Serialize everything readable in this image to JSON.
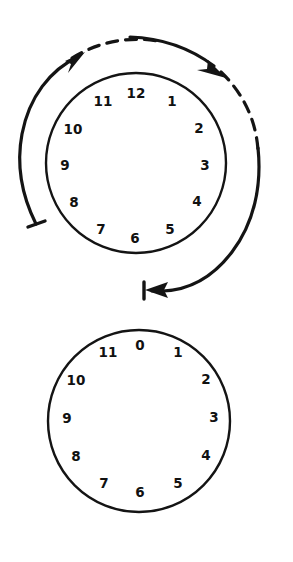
{
  "figure": {
    "background_color": "#ffffff",
    "ink_color": "#141414",
    "width": 293,
    "height": 562
  },
  "clocks": [
    {
      "id": "upper-clock",
      "name": "twelve-hour-dial",
      "center": {
        "x": 136,
        "y": 163
      },
      "radius": 90,
      "numeral_radius": 72,
      "start_label": "12",
      "numerals": [
        {
          "label": "12",
          "angle_deg": 0,
          "x": 136,
          "y": 93
        },
        {
          "label": "1",
          "angle_deg": 30,
          "x": 172,
          "y": 101
        },
        {
          "label": "2",
          "angle_deg": 60,
          "x": 199,
          "y": 128
        },
        {
          "label": "3",
          "angle_deg": 90,
          "x": 205,
          "y": 165
        },
        {
          "label": "4",
          "angle_deg": 120,
          "x": 197,
          "y": 201
        },
        {
          "label": "5",
          "angle_deg": 150,
          "x": 170,
          "y": 229
        },
        {
          "label": "6",
          "angle_deg": 180,
          "x": 135,
          "y": 238
        },
        {
          "label": "7",
          "angle_deg": 210,
          "x": 101,
          "y": 229
        },
        {
          "label": "8",
          "angle_deg": 240,
          "x": 74,
          "y": 202
        },
        {
          "label": "9",
          "angle_deg": 270,
          "x": 65,
          "y": 165
        },
        {
          "label": "10",
          "angle_deg": 300,
          "x": 73,
          "y": 129
        },
        {
          "label": "11",
          "angle_deg": 330,
          "x": 103,
          "y": 101
        }
      ]
    },
    {
      "id": "lower-clock",
      "name": "zero-based-twelve-hour-dial",
      "center": {
        "x": 139,
        "y": 421
      },
      "radius": 91,
      "numeral_radius": 73,
      "start_label": "0",
      "numerals": [
        {
          "label": "0",
          "angle_deg": 0,
          "x": 140,
          "y": 345
        },
        {
          "label": "1",
          "angle_deg": 30,
          "x": 178,
          "y": 352
        },
        {
          "label": "2",
          "angle_deg": 60,
          "x": 206,
          "y": 379
        },
        {
          "label": "3",
          "angle_deg": 90,
          "x": 214,
          "y": 417
        },
        {
          "label": "4",
          "angle_deg": 120,
          "x": 206,
          "y": 455
        },
        {
          "label": "5",
          "angle_deg": 150,
          "x": 178,
          "y": 483
        },
        {
          "label": "6",
          "angle_deg": 180,
          "x": 140,
          "y": 492
        },
        {
          "label": "7",
          "angle_deg": 210,
          "x": 104,
          "y": 483
        },
        {
          "label": "8",
          "angle_deg": 240,
          "x": 76,
          "y": 456
        },
        {
          "label": "9",
          "angle_deg": 270,
          "x": 67,
          "y": 418
        },
        {
          "label": "10",
          "angle_deg": 300,
          "x": 76,
          "y": 380
        },
        {
          "label": "11",
          "angle_deg": 330,
          "x": 108,
          "y": 352
        }
      ]
    }
  ],
  "arrows": [
    {
      "id": "inner-sweep-arrow",
      "name": "clockwise-outer-arc-arrow",
      "style": "solid",
      "direction": "clockwise",
      "start_marker": "tail-bar",
      "end_marker": "arrowhead",
      "description": "Solid arc sweeping clockwise from lower-left tail bar up to an arrowhead near the 11 o'clock position"
    },
    {
      "id": "dashed-sweep-arrow",
      "name": "dashed-clockwise-arc-arrow",
      "style": "dashed",
      "direction": "clockwise",
      "start_marker": "none",
      "end_marker": "arrowhead",
      "description": "Dashed arc running clockwise across the top with an arrowhead near the 1-2 o'clock position"
    },
    {
      "id": "outer-return-arrow",
      "name": "counterclockwise-bottom-arc-arrow",
      "style": "solid",
      "direction": "counterclockwise",
      "start_marker": "none",
      "end_marker": "arrowhead-with-bar",
      "description": "Solid arc sweeping down the right side and along the bottom, ending in a left-pointing arrowhead against a vertical stop bar"
    }
  ]
}
